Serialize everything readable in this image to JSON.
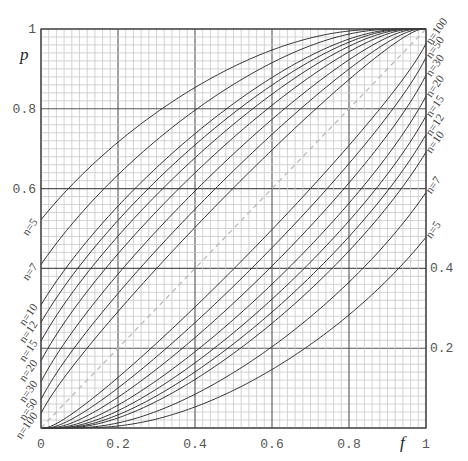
{
  "chart_data": {
    "type": "line",
    "title": "",
    "xlabel": "f",
    "ylabel": "p",
    "xlim": [
      0,
      1
    ],
    "ylim": [
      0,
      1
    ],
    "grid": {
      "major_step": 0.2,
      "minor_step": 0.02,
      "on": true
    },
    "x_ticks": [
      "0",
      "0.2",
      "0.4",
      "0.6",
      "0.8",
      "1"
    ],
    "y_ticks_left": [
      "1",
      "0.8",
      "0.6"
    ],
    "y_ticks_right": [
      "0.4",
      "0.2",
      "1"
    ],
    "confidence_level": 0.95,
    "n_values": [
      5,
      7,
      10,
      12,
      15,
      20,
      30,
      50,
      100
    ],
    "left_labels": [
      "n=5",
      "n=7",
      "n=10",
      "n=12",
      "n=15",
      "n=20",
      "n=30",
      "n=50",
      "n=100"
    ],
    "right_labels": [
      "n=100",
      "n=50",
      "n=30",
      "n=20",
      "n=15",
      "n=12",
      "n=10",
      "n=7",
      "n=5"
    ],
    "upper_at_f0": {
      "5": 0.522,
      "7": 0.41,
      "10": 0.308,
      "12": 0.265,
      "15": 0.218,
      "20": 0.168,
      "30": 0.116,
      "50": 0.071,
      "100": 0.036
    },
    "lower_at_f1": {
      "5": 0.478,
      "7": 0.59,
      "10": 0.692,
      "12": 0.735,
      "15": 0.782,
      "20": 0.832,
      "30": 0.884,
      "50": 0.929,
      "100": 0.964
    },
    "series_samples": [
      {
        "name": "n=5 upper",
        "x": [
          0,
          0.2,
          0.4,
          0.6,
          0.8,
          1
        ],
        "y": [
          0.522,
          0.72,
          0.86,
          0.94,
          0.985,
          1
        ]
      },
      {
        "name": "n=5 lower",
        "x": [
          0,
          0.2,
          0.4,
          0.6,
          0.8,
          1
        ],
        "y": [
          0,
          0.015,
          0.06,
          0.14,
          0.28,
          0.478
        ]
      },
      {
        "name": "diagonal p=f",
        "x": [
          0,
          1
        ],
        "y": [
          0,
          1
        ],
        "style": "dashed",
        "color": "#bbbbbb"
      }
    ],
    "curve_color": "#333333",
    "grid_minor_color": "#c8c8c8",
    "grid_major_color": "#555555"
  },
  "axes": {
    "x_label": "f",
    "y_label": "p"
  }
}
